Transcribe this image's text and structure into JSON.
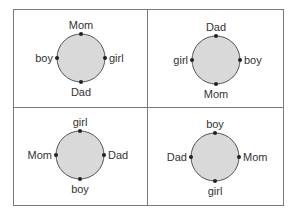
{
  "colors": {
    "border": "#7a7a7a",
    "circle_fill": "#d9d9d9",
    "circle_stroke": "#555555",
    "dot": "#222222",
    "text": "#333333"
  },
  "panels": [
    {
      "top": "Mom",
      "left": "boy",
      "right": "girl",
      "bottom": "Dad"
    },
    {
      "top": "Dad",
      "left": "girl",
      "right": "boy",
      "bottom": "Mom"
    },
    {
      "top": "girl",
      "left": "Mom",
      "right": "Dad",
      "bottom": "boy"
    },
    {
      "top": "boy",
      "left": "Dad",
      "right": "Mom",
      "bottom": "girl"
    }
  ]
}
